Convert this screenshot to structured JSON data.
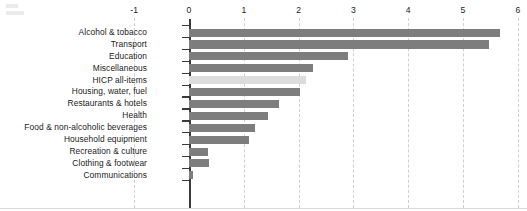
{
  "chart_data": {
    "type": "bar",
    "orientation": "horizontal",
    "title": "",
    "subtitle": "",
    "xlabel": "",
    "ylabel": "",
    "xlim": [
      -1,
      6
    ],
    "ticks": [
      "-1",
      "0",
      "1",
      "2",
      "3",
      "4",
      "5",
      "6"
    ],
    "tick_values": [
      -1,
      0,
      1,
      2,
      3,
      4,
      5,
      6
    ],
    "grid": true,
    "grid_axis": "x",
    "legend": null,
    "axis_position": "top",
    "categories": [
      "Alcohol & tobacco",
      "Transport",
      "Education",
      "Miscellaneous",
      "HICP all-items",
      "Housing, water, fuel",
      "Restaurants & hotels",
      "Health",
      "Food & non-alcoholic beverages",
      "Household equipment",
      "Recreation & culture",
      "Clothing & footwear",
      "Communications"
    ],
    "values": [
      5.67,
      5.47,
      2.9,
      2.26,
      2.14,
      2.02,
      1.64,
      1.44,
      1.2,
      1.09,
      0.35,
      0.37,
      0.08
    ],
    "highlight_category": "HICP all-items",
    "colors": {
      "bar": "#7d7d7d",
      "bar_highlight": "#dcdcdc",
      "axis": "#3a3a3a",
      "gridline": "#cfcfcf",
      "text": "#1b1b1b",
      "background": "#ffffff"
    }
  }
}
